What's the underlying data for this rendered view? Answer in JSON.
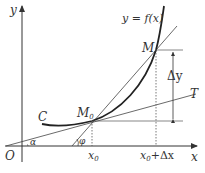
{
  "diagram": {
    "labels": {
      "y_axis": "y",
      "x_axis": "x",
      "origin": "O",
      "function": "y = f(x)",
      "curve": "C",
      "point_m0": "M",
      "point_m0_sub": "0",
      "point_m": "M",
      "delta_y": "Δy",
      "tangent": "T",
      "alpha": "α",
      "phi": "φ",
      "x0": "x",
      "x0_sub": "0",
      "x0_dx": "x",
      "x0_dx_sub": "0",
      "x0_dx_rest": "+Δx"
    },
    "colors": {
      "stroke": "#333333",
      "curve": "#222222",
      "guide": "#555555"
    }
  }
}
